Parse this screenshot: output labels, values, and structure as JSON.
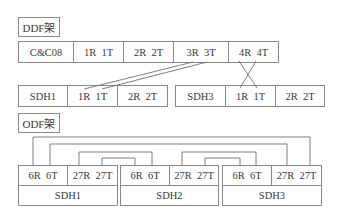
{
  "ddf": {
    "title": "DDF架",
    "top_row": [
      "C&C08",
      "1R  1T",
      "2R  2T",
      "3R  3T",
      "4R  4T"
    ],
    "sdh1_row": [
      "SDH1",
      "1R  1T",
      "2R  2T"
    ],
    "sdh3_row": [
      "SDH3",
      "1R  1T",
      "2R  2T"
    ],
    "connections": [
      {
        "from": "C&C08 3R 3T",
        "to": "SDH1 1R 1T",
        "style": "parallel"
      },
      {
        "from": "C&C08 4R 4T",
        "to": "SDH3 1R 1T",
        "style": "crossed"
      }
    ]
  },
  "odf": {
    "title": "ODF架",
    "units": [
      {
        "name": "SDH1",
        "ports": [
          "6R  6T",
          "27R  27T"
        ]
      },
      {
        "name": "SDH2",
        "ports": [
          "6R  6T",
          "27R  27T"
        ]
      },
      {
        "name": "SDH3",
        "ports": [
          "6R  6T",
          "27R  27T"
        ]
      }
    ],
    "connections": [
      {
        "from": "SDH1 6R",
        "to": "SDH3 27T"
      },
      {
        "from": "SDH1 6T",
        "to": "SDH3 27R"
      },
      {
        "from": "SDH1 27R",
        "to": "SDH2 6T"
      },
      {
        "from": "SDH1 27T",
        "to": "SDH2 6R"
      },
      {
        "from": "SDH2 27R",
        "to": "SDH3 6T"
      },
      {
        "from": "SDH2 27T",
        "to": "SDH3 6R"
      }
    ]
  }
}
